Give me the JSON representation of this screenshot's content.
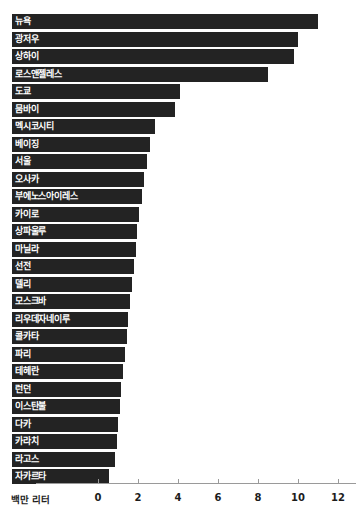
{
  "title_sliver": "",
  "chart_data": {
    "type": "bar",
    "orientation": "horizontal",
    "title": "",
    "xlabel": "백만 리터",
    "ylabel": "",
    "xlim": [
      0,
      12
    ],
    "xticks": [
      0,
      2,
      4,
      6,
      8,
      10,
      12
    ],
    "xtick_labels": [
      "0",
      "2",
      "4",
      "6",
      "8",
      "10",
      "12"
    ],
    "grid": false,
    "legend": null,
    "bar_color": "#232323",
    "label_color": "#ffffff",
    "categories": [
      "뉴욕",
      "광저우",
      "상하이",
      "로스앤젤레스",
      "도쿄",
      "뭄바이",
      "멕시코시티",
      "베이징",
      "서울",
      "오사카",
      "부에노스아이레스",
      "카이로",
      "상파울루",
      "마닐라",
      "선전",
      "델리",
      "모스크바",
      "리우데자네이루",
      "콜카타",
      "파리",
      "테헤란",
      "런던",
      "이스탄불",
      "다카",
      "카라치",
      "라고스",
      "자카르타"
    ],
    "values": [
      11.0,
      10.0,
      9.8,
      8.5,
      4.1,
      3.85,
      2.85,
      2.6,
      2.45,
      2.3,
      2.2,
      2.05,
      1.95,
      1.9,
      1.8,
      1.7,
      1.6,
      1.5,
      1.45,
      1.35,
      1.25,
      1.15,
      1.1,
      1.0,
      0.95,
      0.85,
      0.55
    ]
  }
}
